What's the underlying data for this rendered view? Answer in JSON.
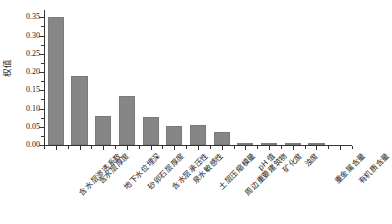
{
  "chart_data": {
    "type": "bar",
    "title": "",
    "xlabel": "",
    "ylabel": "权值",
    "ylim": [
      0.0,
      0.37
    ],
    "yticks": [
      0.0,
      0.05,
      0.1,
      0.15,
      0.2,
      0.25,
      0.3,
      0.35
    ],
    "ytick_labels": [
      "0.00",
      "0.05",
      "0.10",
      "0.15",
      "0.20",
      "0.25",
      "0.30",
      "0.35"
    ],
    "grid": false,
    "legend": null,
    "bar_color": "#868686",
    "axis_color": "#333333",
    "categories": [
      "含水层渗透系数",
      "含水层厚度",
      "地下水位埋深",
      "砂卵石层厚度",
      "含水层承压性",
      "泉水敏感性",
      "土层压缩模量",
      "周边重要建筑物",
      "pH 值",
      "矿化度",
      "浊度",
      "重金属含量",
      "有机质含量"
    ],
    "values": [
      0.35,
      0.19,
      0.08,
      0.133,
      0.076,
      0.051,
      0.054,
      0.037,
      0.006,
      0.001,
      0.006,
      0.006,
      0.0
    ]
  }
}
